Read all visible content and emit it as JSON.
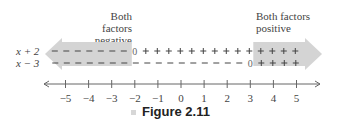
{
  "annotations": {
    "left_region": [
      "Both factors",
      "negative"
    ],
    "right_region": [
      "Both factors",
      "positive"
    ]
  },
  "rows": [
    {
      "label": "x + 2",
      "zero_at": -2
    },
    {
      "label": "x − 3",
      "zero_at": 3
    }
  ],
  "axis": {
    "ticks": [
      "−5",
      "−4",
      "−3",
      "−2",
      "−1",
      "0",
      "1",
      "2",
      "3",
      "4",
      "5"
    ]
  },
  "caption": "Figure 2.11",
  "colors": {
    "arrow_fill": "#d4d4d4",
    "ink": "#444444"
  },
  "chart_data": {
    "type": "sign-chart",
    "title": "Figure 2.11",
    "factors": [
      {
        "name": "x + 2",
        "sign_left_of_zero": "-",
        "zero": -2,
        "sign_right_of_zero": "+"
      },
      {
        "name": "x - 3",
        "sign_left_of_zero": "-",
        "zero": 3,
        "sign_right_of_zero": "+"
      }
    ],
    "regions": [
      {
        "interval": "(-inf, -2)",
        "label": "Both factors negative"
      },
      {
        "interval": "(3, inf)",
        "label": "Both factors positive"
      }
    ],
    "x_ticks": [
      -5,
      -4,
      -3,
      -2,
      -1,
      0,
      1,
      2,
      3,
      4,
      5
    ],
    "xlim": [
      -5.8,
      5.8
    ]
  }
}
